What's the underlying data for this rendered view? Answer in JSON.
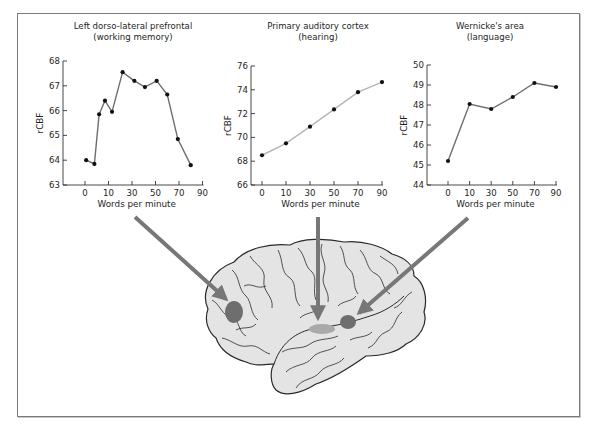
{
  "figure": {
    "x_label": "Words per minute",
    "y_label": "rCBF",
    "colors": {
      "arrow": "#777777",
      "brain_fill": "#e4e4e4",
      "brain_outline": "#2a2a2a",
      "spot_dark": "#6e6e6e",
      "spot_light": "#a9a9a9",
      "line": "#6e6e6e",
      "line_light": "#b5b5b5",
      "frame": "#7a7a7a"
    }
  },
  "chart_data": [
    {
      "type": "line",
      "title": "Left dorso-lateral prefrontal",
      "subtitle": "(working memory)",
      "xlabel": "Words per minute",
      "ylabel": "rCBF",
      "x_tick_labels": [
        "0",
        "10",
        "30",
        "50",
        "70",
        "90"
      ],
      "y_tick_labels": [
        "63",
        "64",
        "65",
        "66",
        "67",
        "68"
      ],
      "ylim": [
        63,
        68
      ],
      "grid": false,
      "note": "x axis tick labels are evenly spaced (non-linear); points are positioned between ticks",
      "points_x_position_ticks": [
        0.05,
        0.4,
        0.6,
        0.85,
        1.15,
        1.6,
        2.1,
        2.55,
        3.05,
        3.5,
        3.95,
        4.5
      ],
      "values": [
        64.0,
        63.85,
        65.85,
        66.4,
        65.95,
        67.55,
        67.2,
        66.95,
        67.2,
        66.65,
        64.85,
        63.8
      ]
    },
    {
      "type": "line",
      "title": "Primary auditory cortex",
      "subtitle": "(hearing)",
      "xlabel": "Words per minute",
      "ylabel": "rCBF",
      "x_tick_labels": [
        "0",
        "10",
        "30",
        "50",
        "70",
        "90"
      ],
      "y_tick_labels": [
        "66",
        "68",
        "70",
        "72",
        "74",
        "76"
      ],
      "ylim": [
        66,
        76
      ],
      "grid": false,
      "categories": [
        "0",
        "10",
        "30",
        "50",
        "70",
        "90"
      ],
      "values": [
        68.5,
        69.5,
        70.9,
        72.35,
        73.8,
        74.65
      ]
    },
    {
      "type": "line",
      "title": "Wernicke's area",
      "subtitle": "(language)",
      "xlabel": "Words per minute",
      "ylabel": "rCBF",
      "x_tick_labels": [
        "0",
        "10",
        "30",
        "50",
        "70",
        "90"
      ],
      "y_tick_labels": [
        "44",
        "45",
        "46",
        "47",
        "48",
        "49",
        "50"
      ],
      "ylim": [
        44,
        50
      ],
      "grid": false,
      "categories": [
        "0",
        "10",
        "30",
        "50",
        "70",
        "90"
      ],
      "values": [
        45.2,
        48.05,
        47.8,
        48.4,
        49.1,
        48.9
      ]
    }
  ],
  "brain": {
    "regions": [
      {
        "name": "Left dorso-lateral prefrontal",
        "shade": "dark"
      },
      {
        "name": "Primary auditory cortex",
        "shade": "light"
      },
      {
        "name": "Wernicke's area",
        "shade": "dark"
      }
    ]
  }
}
